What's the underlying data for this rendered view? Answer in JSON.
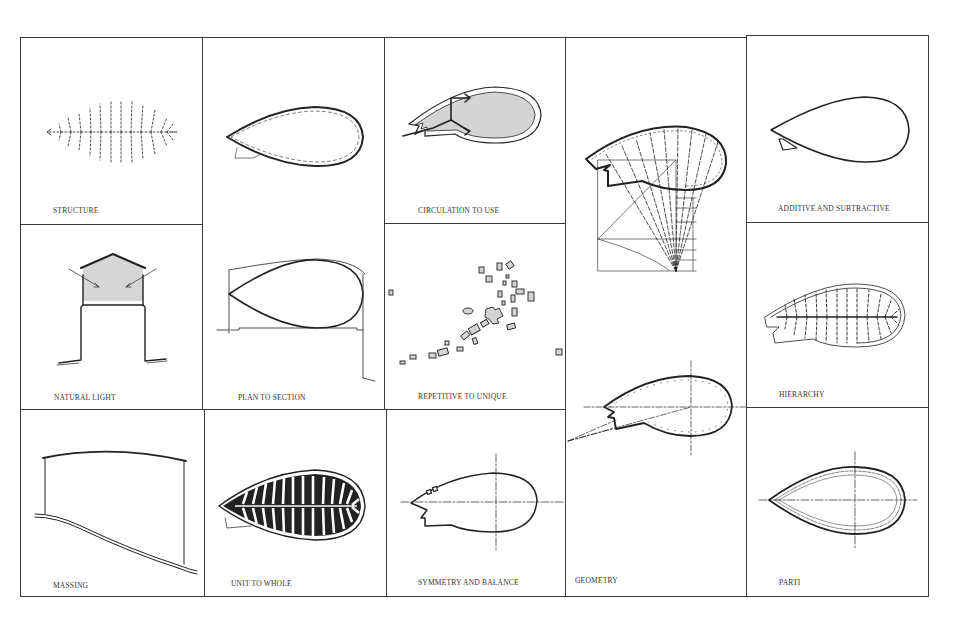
{
  "figure": {
    "layout": "grid of architectural parti diagrams",
    "line_color": "#222222",
    "fill_color": "#d4d4d4",
    "background": "#ffffff"
  },
  "cells": {
    "structure": {
      "label": "STRUCTURE"
    },
    "plan_to_section": {
      "label": "PLAN TO SECTION"
    },
    "circulation_to_use": {
      "label": "CIRCULATION TO USE"
    },
    "geometry": {
      "label": "GEOMETRY",
      "dimension_labels": [
        "EQ",
        "EQ",
        "2A",
        "A",
        "A",
        "A"
      ]
    },
    "additive_and_subtractive": {
      "label": "ADDITIVE AND SUBTRACTIVE"
    },
    "natural_light": {
      "label": "NATURAL LIGHT"
    },
    "repetitive_to_unique": {
      "label": "REPETITIVE TO UNIQUE"
    },
    "hierarchy": {
      "label": "HIERARCHY"
    },
    "massing": {
      "label": "MASSING"
    },
    "unit_to_whole": {
      "label": "UNIT TO WHOLE"
    },
    "symmetry_and_balance": {
      "label": "SYMMETRY AND BALANCE"
    },
    "parti": {
      "label": "PARTI"
    }
  }
}
